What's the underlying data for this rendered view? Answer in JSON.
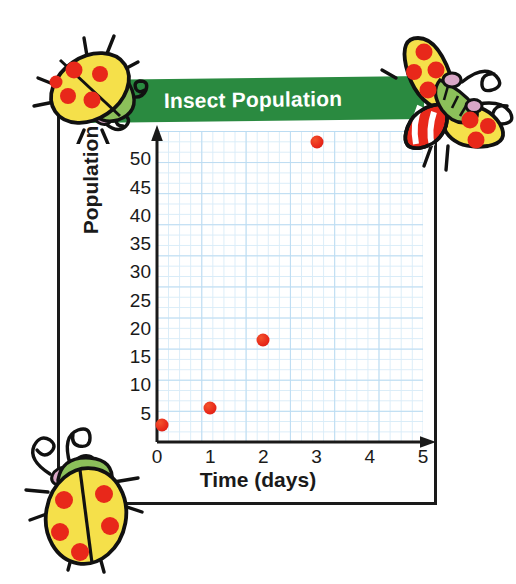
{
  "chart_data": {
    "type": "scatter",
    "title": "Insect Population",
    "xlabel": "Time (days)",
    "ylabel": "Population",
    "x": [
      0.1,
      1,
      2,
      3
    ],
    "values": [
      3,
      6,
      18,
      53
    ],
    "points": [
      {
        "x": 0.1,
        "y": 3
      },
      {
        "x": 1,
        "y": 6
      },
      {
        "x": 2,
        "y": 18
      },
      {
        "x": 3,
        "y": 53
      }
    ],
    "xlim": [
      0,
      5
    ],
    "ylim": [
      0,
      55
    ],
    "x_tick_labels": [
      "0",
      "1",
      "2",
      "3",
      "4",
      "5"
    ],
    "y_tick_labels": [
      "5",
      "10",
      "15",
      "20",
      "25",
      "30",
      "35",
      "40",
      "45",
      "50"
    ],
    "x_ticks": [
      0,
      1,
      2,
      3,
      4,
      5
    ],
    "y_ticks": [
      5,
      10,
      15,
      20,
      25,
      30,
      35,
      40,
      45,
      50
    ],
    "grid": true,
    "grid_color": "#bcdcf2",
    "legend": "none",
    "marker_color": "#e8281a",
    "series": [
      {
        "name": "Insect population",
        "values": [
          3,
          6,
          18,
          53
        ]
      }
    ]
  },
  "banner": {
    "title": "Insect Population",
    "background_color": "#2a8a40",
    "text_color": "#ffffff"
  },
  "axes": {
    "axis_color": "#1a1a1a",
    "x_axis_label": "Time (days)",
    "y_axis_label": "Population"
  },
  "decorations": {
    "ladybug_top_left": "ladybug-icon",
    "butterfly_top_right": "butterfly-icon",
    "ladybug_bottom_left": "ladybug-icon",
    "body_yellow": "#f5e04a",
    "spot_red": "#e8281a",
    "head_green": "#8cc05a",
    "outline": "#111111",
    "antenna_pink": "#d9a7c7"
  },
  "frame": {
    "border_color": "#1a1a1a"
  }
}
